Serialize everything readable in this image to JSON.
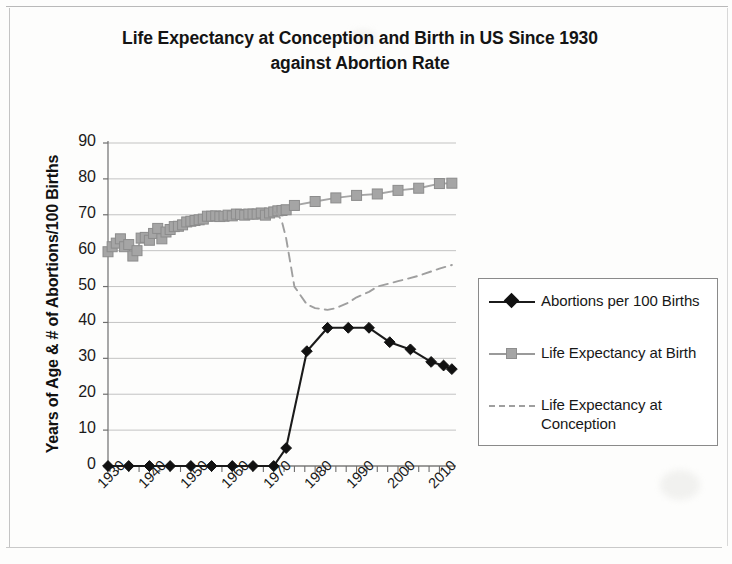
{
  "chart_data": {
    "type": "line",
    "title": "Life Expectancy at Conception and Birth in US Since 1930 against Abortion Rate",
    "title_line1": "Life Expectancy at Conception and Birth in US Since 1930",
    "title_line2": "against Abortion Rate",
    "xlabel": "",
    "ylabel": "Years of Age & # of Abortions/100 Births",
    "xlim": [
      1930,
      2014
    ],
    "ylim": [
      0,
      90
    ],
    "ytick_values": [
      0,
      10,
      20,
      30,
      40,
      50,
      60,
      70,
      80,
      90
    ],
    "ytick_labels": [
      "0",
      "10",
      "20",
      "30",
      "40",
      "50",
      "60",
      "70",
      "80",
      "90"
    ],
    "xtick_values": [
      1930,
      1940,
      1950,
      1960,
      1970,
      1980,
      1990,
      2000,
      2010
    ],
    "xtick_labels": [
      "1930",
      "1940",
      "1950",
      "1960",
      "1970",
      "1980",
      "1990",
      "2000",
      "2010"
    ],
    "minor_xtick_interval": 2.5,
    "grid": "horizontal-major",
    "legend_position": "right-outside",
    "series": [
      {
        "name": "Abortions per 100 Births",
        "color": "#1b1b1b",
        "marker": "diamond",
        "line_style": "solid",
        "x": [
          1930,
          1935,
          1940,
          1945,
          1950,
          1955,
          1960,
          1965,
          1970,
          1973,
          1978,
          1983,
          1988,
          1993,
          1998,
          2003,
          2008,
          2011,
          2013
        ],
        "values": [
          0,
          0,
          0,
          0,
          0,
          0,
          0,
          0,
          0,
          5,
          32,
          38.5,
          38.5,
          38.5,
          34.5,
          32.5,
          29,
          28,
          27
        ]
      },
      {
        "name": "Life Expectancy at Birth",
        "color": "#a5a5a5",
        "marker": "square",
        "line_style": "solid",
        "x": [
          1930,
          1931,
          1932,
          1933,
          1934,
          1935,
          1936,
          1937,
          1938,
          1939,
          1940,
          1941,
          1942,
          1943,
          1944,
          1945,
          1946,
          1947,
          1948,
          1949,
          1950,
          1951,
          1952,
          1953,
          1954,
          1955,
          1956,
          1957,
          1958,
          1959,
          1960,
          1961,
          1962,
          1963,
          1964,
          1965,
          1966,
          1967,
          1968,
          1969,
          1970,
          1971,
          1972,
          1973,
          1975,
          1980,
          1985,
          1990,
          1995,
          2000,
          2005,
          2010,
          2013
        ],
        "values": [
          59.7,
          61.1,
          62.1,
          63.3,
          61.1,
          61.7,
          58.5,
          60.0,
          63.5,
          63.7,
          62.9,
          64.8,
          66.2,
          63.3,
          65.2,
          65.9,
          66.7,
          66.8,
          67.2,
          68.0,
          68.2,
          68.4,
          68.6,
          68.8,
          69.6,
          69.6,
          69.7,
          69.5,
          69.6,
          69.9,
          69.7,
          70.2,
          70.1,
          69.9,
          70.2,
          70.2,
          70.2,
          70.5,
          69.9,
          70.5,
          70.8,
          71.1,
          71.2,
          71.4,
          72.6,
          73.7,
          74.7,
          75.4,
          75.8,
          76.8,
          77.4,
          78.7,
          78.8
        ]
      },
      {
        "name": "Life Expectancy at Conception",
        "color": "#9f9f9f",
        "marker": "none",
        "line_style": "dashed",
        "x": [
          1970,
          1971,
          1972,
          1973,
          1975,
          1978,
          1980,
          1983,
          1985,
          1988,
          1990,
          1993,
          1995,
          2000,
          2005,
          2010,
          2013
        ],
        "values": [
          70.8,
          70.2,
          68.0,
          63.5,
          50.0,
          45.0,
          44.0,
          43.5,
          44.0,
          45.5,
          47.0,
          48.5,
          50.0,
          51.5,
          53.0,
          55.0,
          56.0
        ]
      }
    ]
  },
  "legend": {
    "items": [
      {
        "label": "Abortions per 100 Births",
        "key": "diamond-solid-dark"
      },
      {
        "label": "Life Expectancy at Birth",
        "key": "square-solid-gray"
      },
      {
        "label": "Life Expectancy at Conception",
        "key": "dashed-gray"
      }
    ]
  }
}
